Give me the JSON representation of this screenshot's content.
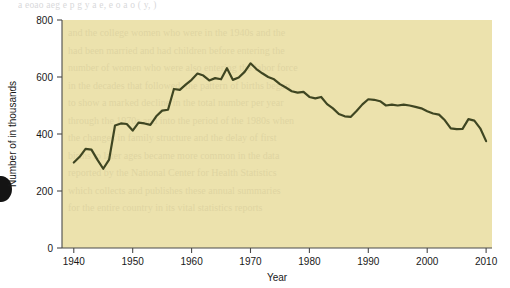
{
  "page": {
    "top_text_line": "a eoao aeg  e p  g  y a e,         e  o a        o                          (            y,      )",
    "background_color": "#ffffff"
  },
  "figure": {
    "panel_color": "#ece2ad",
    "line_color": "#3f4622",
    "axis_color": "#4a4a4a"
  },
  "chart_data": {
    "type": "line",
    "title": "",
    "xlabel": "Year",
    "ylabel": "Number of in thousands",
    "xlim": [
      1938,
      2011
    ],
    "ylim": [
      0,
      800
    ],
    "xticks": [
      1940,
      1950,
      1960,
      1970,
      1980,
      1990,
      2000,
      2010
    ],
    "yticks": [
      0,
      200,
      400,
      600,
      800
    ],
    "grid": false,
    "legend": "none",
    "series": [
      {
        "name": "Number of in thousands",
        "x": [
          1940,
          1941,
          1942,
          1943,
          1944,
          1945,
          1946,
          1947,
          1948,
          1949,
          1950,
          1951,
          1952,
          1953,
          1954,
          1955,
          1956,
          1957,
          1958,
          1959,
          1960,
          1961,
          1962,
          1963,
          1964,
          1965,
          1966,
          1967,
          1968,
          1969,
          1970,
          1971,
          1972,
          1973,
          1974,
          1975,
          1976,
          1977,
          1978,
          1979,
          1980,
          1981,
          1982,
          1983,
          1984,
          1985,
          1986,
          1987,
          1988,
          1989,
          1990,
          1991,
          1992,
          1993,
          1994,
          1995,
          1996,
          1997,
          1998,
          1999,
          2000,
          2001,
          2002,
          2003,
          2004,
          2005,
          2006,
          2007,
          2008,
          2009,
          2010
        ],
        "values": [
          300,
          320,
          348,
          345,
          310,
          278,
          310,
          430,
          437,
          435,
          412,
          440,
          437,
          432,
          462,
          482,
          485,
          558,
          555,
          573,
          590,
          612,
          605,
          588,
          596,
          592,
          631,
          590,
          598,
          618,
          648,
          628,
          613,
          600,
          592,
          575,
          563,
          550,
          545,
          548,
          530,
          525,
          530,
          505,
          490,
          470,
          462,
          460,
          481,
          504,
          522,
          520,
          515,
          500,
          503,
          500,
          503,
          500,
          495,
          490,
          480,
          472,
          468,
          448,
          420,
          417,
          418,
          452,
          447,
          420,
          375
        ]
      }
    ]
  },
  "axis": {
    "y_tick_labels": [
      "800",
      "600",
      "400",
      "200",
      "0"
    ],
    "x_tick_labels": [
      "1940",
      "1950",
      "1960",
      "1970",
      "1980",
      "1990",
      "2000",
      "2010"
    ],
    "x_axis_title": "Year",
    "y_axis_title": "Number of in thousands"
  }
}
